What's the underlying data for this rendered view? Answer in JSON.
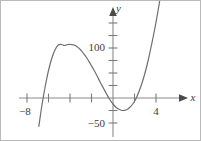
{
  "figure": {
    "name": "cubic-function-graph",
    "background_color": "#ffffff",
    "border_color": "#b9b9b9",
    "curve_color": "#6e6e6e",
    "axis_color": "#7a7a7a",
    "text_color": "#3a3a3a"
  },
  "axes": {
    "x_axis_label": "x",
    "y_axis_label": "y",
    "x_tick_labels": [
      "−8",
      "4"
    ],
    "y_tick_labels": [
      "100",
      "−50"
    ],
    "x_label_minus_eight": "−8",
    "x_label_four": "4",
    "y_label_hundred": "100",
    "y_label_minus_fifty": "−50",
    "arrowheads": [
      "x-positive",
      "y-positive"
    ]
  },
  "chart_data": {
    "type": "line",
    "title": "",
    "xlabel": "x",
    "ylabel": "y",
    "xlim": [
      -9.0,
      4.6
    ],
    "ylim": [
      -62,
      135
    ],
    "grid": false,
    "legend": null,
    "x_ticks": [
      -8,
      -6,
      -4,
      -2,
      0,
      2,
      4
    ],
    "x_tick_labels_shown": {
      "-8": "−8",
      "4": "4"
    },
    "y_ticks": [
      -50,
      -25,
      0,
      25,
      50,
      75,
      100,
      125
    ],
    "y_tick_labels_shown": {
      "100": "100",
      "-50": "−50"
    },
    "series": [
      {
        "name": "cubic",
        "roots": [
          -6.45,
          -0.12,
          2.78
        ],
        "local_maximum": {
          "x": -3.7,
          "y": 107
        },
        "local_minimum": {
          "x": 1.25,
          "y": -22
        },
        "domain": [
          -6.9,
          4.45
        ],
        "x": [
          -6.9,
          -6.6,
          -6.3,
          -6.0,
          -5.7,
          -5.4,
          -5.1,
          -4.8,
          -4.5,
          -4.2,
          -3.9,
          -3.6,
          -3.3,
          -3.0,
          -2.7,
          -2.4,
          -2.1,
          -1.8,
          -1.5,
          -1.2,
          -0.9,
          -0.6,
          -0.3,
          0.0,
          0.3,
          0.6,
          0.9,
          1.2,
          1.5,
          1.8,
          2.1,
          2.4,
          2.7,
          3.0,
          3.3,
          3.6,
          3.9,
          4.2,
          4.45
        ],
        "y": [
          -57,
          -13,
          24,
          55,
          79,
          96,
          106,
          107,
          105,
          107,
          107,
          106,
          102,
          96,
          88,
          79,
          68,
          57,
          45,
          32,
          20,
          8,
          -3,
          -12,
          -19,
          -23,
          -25,
          -24,
          -20,
          -13,
          -3,
          12,
          30,
          52,
          78,
          108,
          140,
          176,
          208
        ]
      }
    ]
  }
}
